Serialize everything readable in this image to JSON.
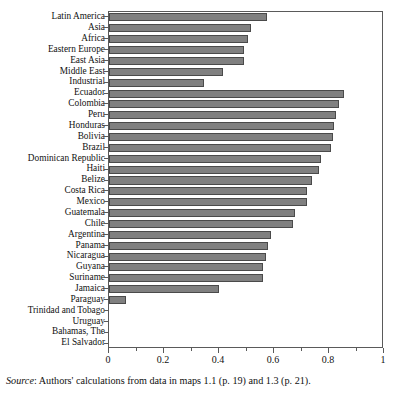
{
  "chart_data": {
    "type": "bar",
    "orientation": "horizontal",
    "title": "",
    "subtitle": "",
    "xlabel": "",
    "ylabel": "",
    "xlim": [
      0,
      1
    ],
    "ylim": null,
    "grid": false,
    "legend": null,
    "legend_position": "none",
    "bar_color": "#808080",
    "bar_edge_color": "#4a4a4a",
    "axis_color": "#5a5a5a",
    "xticks": [
      0,
      0.2,
      0.4,
      0.6,
      0.8,
      1
    ],
    "xtick_labels": [
      "0",
      "0.2",
      "0.4",
      "0.6",
      "0.8",
      "1"
    ],
    "xticks_minor": [
      0.1,
      0.3,
      0.5,
      0.7,
      0.9
    ],
    "categories": [
      "Latin America",
      "Asia",
      "Africa",
      "Eastern Europe",
      "East Asia",
      "Middle East",
      "Industrial",
      "Ecuador",
      "Colombia",
      "Peru",
      "Honduras",
      "Bolivia",
      "Brazil",
      "Dominican Republic",
      "Haiti",
      "Belize",
      "Costa Rica",
      "Mexico",
      "Guatemala",
      "Chile",
      "Argentina",
      "Panama",
      "Nicaragua",
      "Guyana",
      "Suriname",
      "Jamaica",
      "Paraguay",
      "Trinidad and Tobago",
      "Uruguay",
      "Bahamas, The",
      "El Salvador"
    ],
    "values": [
      0.575,
      0.517,
      0.505,
      0.491,
      0.491,
      0.415,
      0.345,
      0.854,
      0.836,
      0.825,
      0.818,
      0.814,
      0.807,
      0.771,
      0.764,
      0.738,
      0.72,
      0.72,
      0.676,
      0.669,
      0.589,
      0.578,
      0.571,
      0.56,
      0.56,
      0.4,
      0.062,
      0.0,
      0.0,
      0.0,
      0.0
    ]
  },
  "source": {
    "label": "Source",
    "separator": ":",
    "text": "Authors' calculations from data in maps 1.1 (p. 19) and 1.3 (p. 21)."
  }
}
